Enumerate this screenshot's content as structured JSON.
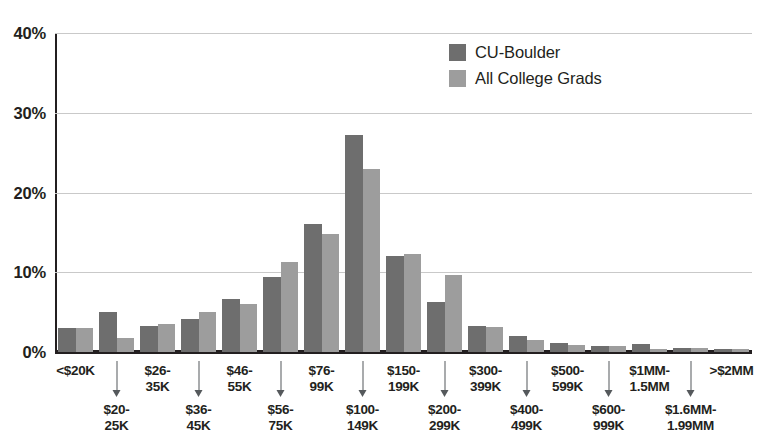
{
  "chart_data": {
    "type": "bar",
    "title": "",
    "subtitle": "",
    "xlabel": "",
    "ylabel": "",
    "grid": true,
    "legend_position": "top-right",
    "ylim": [
      0,
      40
    ],
    "ytick_labels": [
      "40%",
      "30%",
      "20%",
      "10%",
      "0%"
    ],
    "ytick_values": [
      40,
      30,
      20,
      10,
      0
    ],
    "categories": [
      "<$20K",
      "$20-25K",
      "$26-35K",
      "$36-45K",
      "$46-55K",
      "$56-75K",
      "$76-99K",
      "$100-149K",
      "$150-199K",
      "$200-299K",
      "$300-399K",
      "$400-499K",
      "$500-599K",
      "$600-999K",
      "$1MM-1.5MM",
      "$1.6MM-1.99MM",
      ">$2MM"
    ],
    "category_rows": [
      {
        "line1": "<$20K",
        "line2": "",
        "row": "top"
      },
      {
        "line1": "$20-",
        "line2": "25K",
        "row": "bottom"
      },
      {
        "line1": "$26-",
        "line2": "35K",
        "row": "top"
      },
      {
        "line1": "$36-",
        "line2": "45K",
        "row": "bottom"
      },
      {
        "line1": "$46-",
        "line2": "55K",
        "row": "top"
      },
      {
        "line1": "$56-",
        "line2": "75K",
        "row": "bottom"
      },
      {
        "line1": "$76-",
        "line2": "99K",
        "row": "top"
      },
      {
        "line1": "$100-",
        "line2": "149K",
        "row": "bottom"
      },
      {
        "line1": "$150-",
        "line2": "199K",
        "row": "top"
      },
      {
        "line1": "$200-",
        "line2": "299K",
        "row": "bottom"
      },
      {
        "line1": "$300-",
        "line2": "399K",
        "row": "top"
      },
      {
        "line1": "$400-",
        "line2": "499K",
        "row": "bottom"
      },
      {
        "line1": "$500-",
        "line2": "599K",
        "row": "top"
      },
      {
        "line1": "$600-",
        "line2": "999K",
        "row": "bottom"
      },
      {
        "line1": "$1MM-",
        "line2": "1.5MM",
        "row": "top"
      },
      {
        "line1": "$1.6MM-",
        "line2": "1.99MM",
        "row": "bottom"
      },
      {
        "line1": ">$2MM",
        "line2": "",
        "row": "top"
      }
    ],
    "series": [
      {
        "name": "CU-Boulder",
        "color": "#6e6e6e",
        "values": [
          3.0,
          5.0,
          3.2,
          4.1,
          6.6,
          9.4,
          16.1,
          27.2,
          12.0,
          6.3,
          3.3,
          2.0,
          1.1,
          0.7,
          1.0,
          0.5,
          0.4
        ]
      },
      {
        "name": "All College Grads",
        "color": "#9d9d9d",
        "values": [
          3.0,
          1.8,
          3.5,
          5.0,
          6.0,
          11.3,
          14.8,
          23.0,
          12.3,
          9.6,
          3.1,
          1.5,
          0.9,
          0.8,
          0.4,
          0.5,
          0.4
        ]
      }
    ]
  },
  "legend": {
    "items": [
      {
        "label": "CU-Boulder"
      },
      {
        "label": "All College Grads"
      }
    ]
  },
  "colors": {
    "series_0": "#6e6e6e",
    "series_1": "#9d9d9d",
    "axis": "#231f20",
    "grid": "#c9c9c9",
    "tick_arrow": "#55595c",
    "background": "#ffffff"
  }
}
